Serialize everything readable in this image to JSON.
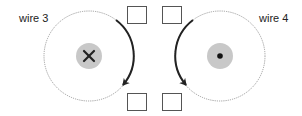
{
  "wires": [
    {
      "label": "wire 3",
      "current_direction": "into-page",
      "symbol": "cross-icon",
      "field_arrow": "clockwise"
    },
    {
      "label": "wire 4",
      "current_direction": "out-of-page",
      "symbol": "dot-icon",
      "field_arrow": "counterclockwise"
    }
  ],
  "answer_boxes": [
    {
      "name": "answer-box-top-left",
      "value": ""
    },
    {
      "name": "answer-box-top-right",
      "value": ""
    },
    {
      "name": "answer-box-bottom-left",
      "value": ""
    },
    {
      "name": "answer-box-bottom-right",
      "value": ""
    }
  ],
  "colors": {
    "wire_fill": "#c8c8c8",
    "stroke": "#222222",
    "field_line": "#888888"
  }
}
